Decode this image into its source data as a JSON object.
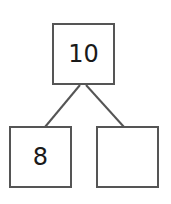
{
  "diagram": {
    "type": "number-bond",
    "whole": {
      "value": "10"
    },
    "parts": [
      {
        "value": "8"
      },
      {
        "value": ""
      }
    ],
    "line_color": "#555555"
  }
}
